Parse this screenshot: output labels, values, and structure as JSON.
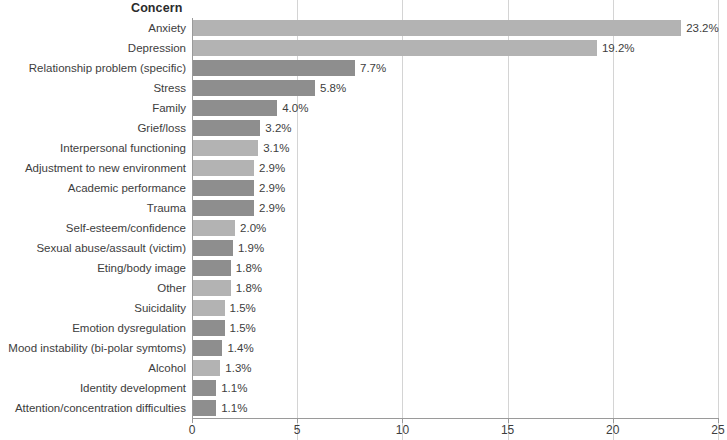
{
  "chart_data": {
    "type": "bar",
    "orientation": "horizontal",
    "title": "Concern",
    "xlabel": "",
    "ylabel": "",
    "xlim": [
      0,
      25
    ],
    "xticks": [
      0,
      5,
      10,
      15,
      20,
      25
    ],
    "xtick_labels": [
      "0",
      "5",
      "10",
      "15",
      "20",
      "25"
    ],
    "grid": true,
    "grid_axis": "x",
    "legend": false,
    "value_suffix": "%",
    "categories": [
      "Anxiety",
      "Depression",
      "Relationship problem (specific)",
      "Stress",
      "Family",
      "Grief/loss",
      "Interpersonal functioning",
      "Adjustment to new environment",
      "Academic performance",
      "Trauma",
      "Self-esteem/confidence",
      "Sexual abuse/assault (victim)",
      "Eting/body image",
      "Other",
      "Suicidality",
      "Emotion dysregulation",
      "Mood instability (bi-polar symtoms)",
      "Alcohol",
      "Identity development",
      "Attention/concentration difficulties"
    ],
    "values": [
      23.2,
      19.2,
      7.7,
      5.8,
      4.0,
      3.2,
      3.1,
      2.9,
      2.9,
      2.9,
      2.0,
      1.9,
      1.8,
      1.8,
      1.5,
      1.5,
      1.4,
      1.3,
      1.1,
      1.1
    ],
    "data_labels": [
      "23.2%",
      "19.2%",
      "7.7%",
      "5.8%",
      "4.0%",
      "3.2%",
      "3.1%",
      "2.9%",
      "2.9%",
      "2.9%",
      "2.0%",
      "1.9%",
      "1.8%",
      "1.8%",
      "1.5%",
      "1.5%",
      "1.4%",
      "1.3%",
      "1.1%",
      "1.1%"
    ],
    "bar_shades": [
      "light",
      "light",
      "dark",
      "dark",
      "dark",
      "dark",
      "light",
      "light",
      "dark",
      "dark",
      "light",
      "dark",
      "dark",
      "light",
      "light",
      "dark",
      "dark",
      "light",
      "dark",
      "dark"
    ],
    "colors": {
      "bar_light": "#b3b3b3",
      "bar_dark": "#8e8e8e",
      "grid": "#d4d4d4",
      "axis": "#9a9a9a",
      "text": "#3d3d3d",
      "title": "#2b2b2b"
    }
  }
}
